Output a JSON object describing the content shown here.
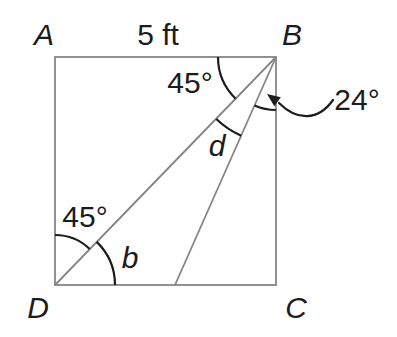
{
  "figure": {
    "colors": {
      "background": "#ffffff",
      "line": "#858585",
      "ink": "#1c1c1c"
    },
    "labels": {
      "vertex_a": "A",
      "vertex_b": "B",
      "vertex_c": "C",
      "vertex_d": "D",
      "side_ab_length": "5 ft",
      "angle_abd": "45°",
      "angle_d": "d",
      "angle_ebc": "24°",
      "angle_adb": "45°",
      "angle_b": "b"
    }
  }
}
